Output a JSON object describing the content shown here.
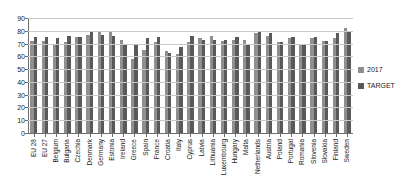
{
  "chart_data": {
    "type": "bar",
    "title": "",
    "xlabel": "",
    "ylabel": "",
    "ylim": [
      0,
      90
    ],
    "ytick_step": 10,
    "yticks": [
      90,
      80,
      70,
      60,
      50,
      40,
      30,
      20,
      10,
      0
    ],
    "grid": true,
    "legend_position": "right",
    "colors": {
      "2017": "#8f8f8f",
      "TARGET": "#595959",
      "grid": "#c9c9c9",
      "axis": "#6e6e6e",
      "background": "#ffffff"
    },
    "categories": [
      "EU 28",
      "EU 27",
      "Belgium",
      "Bulgaria",
      "Czechia",
      "Denmark",
      "Germany",
      "Estonia",
      "Ireland",
      "Greece",
      "Spain",
      "France",
      "Croatia",
      "Italy",
      "Cyprus",
      "Latvia",
      "Lithuania",
      "Luxembourg",
      "Hungary",
      "Malta",
      "Netherlands",
      "Austria",
      "Poland",
      "Portugal",
      "Romania",
      "Slovenia",
      "Slovakia",
      "Finland",
      "Sweden"
    ],
    "series": [
      {
        "name": "2017",
        "values": [
          72,
          72,
          69,
          71,
          75,
          77,
          79,
          79,
          73,
          58,
          65,
          71,
          64,
          62,
          71,
          74,
          76,
          72,
          73,
          73,
          78,
          76,
          71,
          74,
          69,
          74,
          72,
          74,
          82
        ]
      },
      {
        "name": "TARGET",
        "values": [
          75,
          75,
          74,
          76,
          75,
          80,
          77,
          76,
          69,
          70,
          74,
          75,
          63,
          67,
          76,
          73,
          73,
          73,
          75,
          70,
          80,
          78,
          71,
          75,
          70,
          75,
          72,
          78,
          80
        ]
      }
    ]
  },
  "legend": {
    "entries": [
      {
        "label": "2017",
        "swatch_name": "legend-swatch-2017"
      },
      {
        "label": "TARGET",
        "swatch_name": "legend-swatch-target"
      }
    ]
  }
}
